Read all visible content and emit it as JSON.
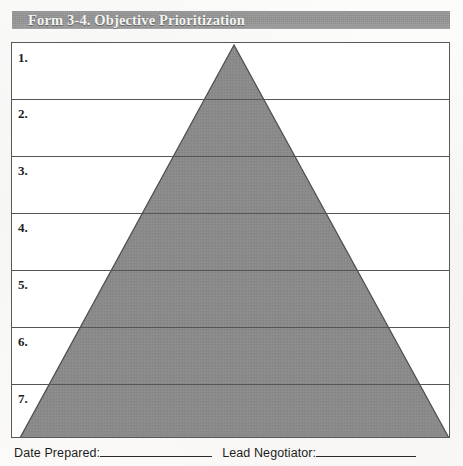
{
  "document": {
    "header_title": "Form 3-4. Objective Prioritization",
    "header_bar_color": "#8f8f8f",
    "page_background": "#fbfbfa",
    "box_border_color": "#585858"
  },
  "form": {
    "rows": [
      {
        "number": "1."
      },
      {
        "number": "2."
      },
      {
        "number": "3."
      },
      {
        "number": "4."
      },
      {
        "number": "5."
      },
      {
        "number": "6."
      },
      {
        "number": "7."
      }
    ]
  },
  "pyramid": {
    "fill_color": "#8a8a8a",
    "stroke_color": "#4a4a4a",
    "apex_x": 222,
    "apex_y": 2,
    "base_left_x": 8,
    "base_right_x": 437,
    "base_y": 395
  },
  "footer": {
    "date_label": "Date Prepared:",
    "negotiator_label": "Lead Negotiator:"
  }
}
